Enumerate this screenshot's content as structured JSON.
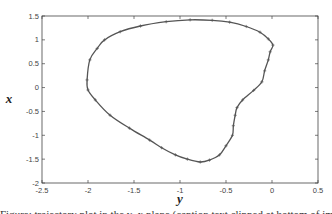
{
  "chart_data": {
    "type": "line",
    "title": "",
    "xlabel": "y",
    "ylabel": "x",
    "xlim": [
      -2.5,
      0.5
    ],
    "ylim": [
      -2,
      1.5
    ],
    "grid": false,
    "legend": null,
    "x_ticks": [
      -2.5,
      -2,
      -1.5,
      -1,
      -0.5,
      0,
      0.5
    ],
    "x_tick_labels": [
      "-2.5",
      "-2",
      "-1.5",
      "-1",
      "-0.5",
      "0",
      "0.5"
    ],
    "y_ticks": [
      -2,
      -1.5,
      -1,
      -0.5,
      0,
      0.5,
      1,
      1.5
    ],
    "y_tick_labels": [
      "-2",
      "-1.5",
      "-1",
      "-0.5",
      "0",
      "0.5",
      "1",
      "1.5"
    ],
    "series": [
      {
        "name": "closed trajectory",
        "closed": true,
        "marker": "+",
        "color": "#555555",
        "x": [
          -2.01,
          -1.98,
          -1.9,
          -1.82,
          -1.65,
          -1.43,
          -1.15,
          -0.89,
          -0.65,
          -0.46,
          -0.28,
          -0.13,
          -0.04,
          0.01,
          -0.02,
          -0.04,
          -0.08,
          -0.11,
          -0.2,
          -0.32,
          -0.38,
          -0.4,
          -0.42,
          -0.43,
          -0.5,
          -0.57,
          -0.68,
          -0.78,
          -0.92,
          -1.05,
          -1.2,
          -1.33,
          -1.55,
          -1.76,
          -1.92,
          -2.0
        ],
        "y": [
          0.16,
          0.58,
          0.82,
          1.0,
          1.17,
          1.29,
          1.38,
          1.42,
          1.41,
          1.37,
          1.28,
          1.16,
          1.02,
          0.89,
          0.75,
          0.58,
          0.35,
          0.12,
          -0.06,
          -0.26,
          -0.42,
          -0.58,
          -0.8,
          -1.0,
          -1.22,
          -1.41,
          -1.52,
          -1.56,
          -1.5,
          -1.41,
          -1.26,
          -1.1,
          -0.85,
          -0.58,
          -0.26,
          -0.05
        ]
      }
    ]
  },
  "caption": {
    "text": "Figure: trajectory plot in the y–x plane (caption text clipped at bottom of image)"
  }
}
